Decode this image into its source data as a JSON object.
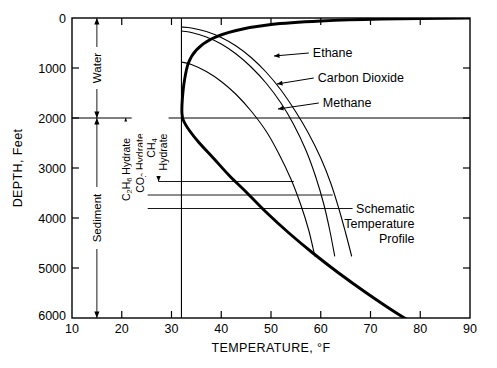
{
  "figure": {
    "title": "",
    "background": "#ffffff",
    "line_color": "#000000"
  },
  "chart_data": {
    "type": "line",
    "title": "",
    "xlabel": "TEMPERATURE, °F",
    "ylabel": "DEPTH, Feet",
    "xlim": [
      10,
      90
    ],
    "ylim": [
      6000,
      0
    ],
    "y_inverted": true,
    "grid": false,
    "xticks": [
      10,
      20,
      30,
      40,
      50,
      60,
      70,
      80,
      90
    ],
    "xtick_labels": [
      "10",
      "20",
      "30",
      "40",
      "50",
      "60",
      "70",
      "80",
      "90"
    ],
    "yticks": [
      0,
      1000,
      2000,
      3000,
      4000,
      5000,
      6000
    ],
    "ytick_labels": [
      "0",
      "1000",
      "2000",
      "3000",
      "4000",
      "5000",
      "6000"
    ],
    "legend_position": "inline-annotations",
    "series": [
      {
        "name": "Schematic Temperature Profile",
        "style": "thick",
        "points": [
          [
            90,
            0
          ],
          [
            72,
            20
          ],
          [
            60,
            60
          ],
          [
            50,
            130
          ],
          [
            43,
            250
          ],
          [
            38,
            420
          ],
          [
            35,
            640
          ],
          [
            33.4,
            900
          ],
          [
            32.6,
            1250
          ],
          [
            32.2,
            1600
          ],
          [
            32.1,
            1900
          ],
          [
            32.4,
            2050
          ],
          [
            33.6,
            2250
          ],
          [
            35.6,
            2500
          ],
          [
            38.4,
            2800
          ],
          [
            41.6,
            3150
          ],
          [
            45.2,
            3500
          ],
          [
            49.2,
            3900
          ],
          [
            53.6,
            4300
          ],
          [
            58.4,
            4700
          ],
          [
            63.6,
            5100
          ],
          [
            69.2,
            5500
          ],
          [
            75.2,
            5900
          ],
          [
            79.4,
            6150
          ]
        ]
      },
      {
        "name": "Methane",
        "style": "thin",
        "points": [
          [
            32.0,
            180
          ],
          [
            34.0,
            200
          ],
          [
            37.0,
            270
          ],
          [
            40.0,
            390
          ],
          [
            43.0,
            560
          ],
          [
            46.0,
            790
          ],
          [
            49.0,
            1080
          ],
          [
            52.0,
            1440
          ],
          [
            55.0,
            1880
          ],
          [
            57.5,
            2300
          ],
          [
            60.0,
            2800
          ],
          [
            62.0,
            3300
          ],
          [
            63.6,
            3800
          ],
          [
            65.0,
            4300
          ],
          [
            66.2,
            4760
          ]
        ]
      },
      {
        "name": "Carbon Dioxide",
        "style": "thin",
        "points": [
          [
            32.0,
            260
          ],
          [
            34.0,
            290
          ],
          [
            37.0,
            380
          ],
          [
            40.0,
            520
          ],
          [
            43.0,
            720
          ],
          [
            46.0,
            980
          ],
          [
            49.0,
            1300
          ],
          [
            52.0,
            1700
          ],
          [
            54.5,
            2120
          ],
          [
            57.0,
            2640
          ],
          [
            59.0,
            3180
          ],
          [
            60.6,
            3720
          ],
          [
            61.8,
            4240
          ],
          [
            62.8,
            4760
          ]
        ]
      },
      {
        "name": "Ethane",
        "style": "thin",
        "points": [
          [
            32.0,
            880
          ],
          [
            34.0,
            930
          ],
          [
            37.0,
            1070
          ],
          [
            40.0,
            1270
          ],
          [
            43.0,
            1530
          ],
          [
            46.0,
            1860
          ],
          [
            49.0,
            2260
          ],
          [
            51.5,
            2700
          ],
          [
            54.0,
            3220
          ],
          [
            56.0,
            3740
          ],
          [
            57.6,
            4250
          ],
          [
            58.8,
            4760
          ]
        ]
      }
    ],
    "reference_lines": [
      {
        "name": "freezing-line",
        "orientation": "vertical",
        "value": 32,
        "label": "32 °F"
      },
      {
        "name": "water-sediment-boundary",
        "orientation": "horizontal",
        "value": 2000,
        "label": "2000 ft"
      },
      {
        "name": "ch4-hydrate-base",
        "orientation": "horizontal",
        "value": 3270,
        "label": ""
      },
      {
        "name": "co2-hydrate-base",
        "orientation": "horizontal",
        "value": 3540,
        "label": ""
      },
      {
        "name": "c2h6-hydrate-base",
        "orientation": "horizontal",
        "value": 3810,
        "label": ""
      }
    ],
    "annotations": [
      {
        "name": "ethane",
        "text": "Ethane",
        "x": 56,
        "y": 700
      },
      {
        "name": "carbon-dioxide",
        "text": "Carbon Dioxide",
        "x": 57,
        "y": 1200
      },
      {
        "name": "methane",
        "text": "Methane",
        "x": 58,
        "y": 1700
      },
      {
        "name": "schematic-profile",
        "text_lines": [
          "Schematic",
          "Temperature",
          "Profile"
        ],
        "x": 72,
        "y": 3900
      }
    ],
    "brackets": [
      {
        "name": "water",
        "label": "Water",
        "from_depth": 0,
        "to_depth": 2000,
        "at_temperature": 15
      },
      {
        "name": "sediment",
        "label": "Sediment",
        "from_depth": 2000,
        "to_depth": 6000,
        "at_temperature": 15
      },
      {
        "name": "c2h6-hydrate",
        "label": "C2H6 Hydrate",
        "from_depth": 2000,
        "to_depth": 3810,
        "at_temperature": 20.8
      },
      {
        "name": "co2-hydrate",
        "label": "CO2 Hydrate",
        "from_depth": 2000,
        "to_depth": 3540,
        "at_temperature": 23.6
      },
      {
        "name": "ch4-hydrate",
        "label": "CH4 Hydrate",
        "from_depth": 2000,
        "to_depth": 3270,
        "at_temperature": 27.4
      }
    ]
  },
  "labels": {
    "x_axis_title": "TEMPERATURE, °F",
    "y_axis_title": "DEPTH, Feet",
    "water": "Water",
    "sediment": "Sediment",
    "ethane": "Ethane",
    "carbon_dioxide": "Carbon Dioxide",
    "methane": "Methane",
    "schematic_l1": "Schematic",
    "schematic_l2": "Temperature",
    "schematic_l3": "Profile",
    "c2h6_pre": "C",
    "c2h6_sub1": "2",
    "c2h6_mid": "H",
    "c2h6_sub2": "6",
    "c2h6_post": " Hydrate",
    "co2_pre": "CO",
    "co2_sub": "2",
    "co2_post": " Hydrate",
    "ch4_pre": "CH",
    "ch4_sub": "4",
    "ch4_post": "Hydrate"
  }
}
